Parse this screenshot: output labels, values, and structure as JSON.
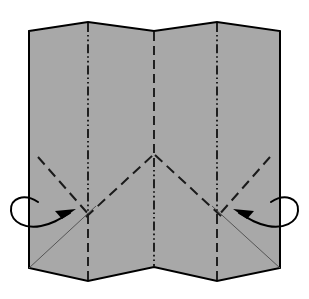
{
  "figure": {
    "type": "folding-instruction-diagram",
    "canvas": {
      "width": 309,
      "height": 299,
      "background": "#ffffff"
    },
    "colors": {
      "paper_fill": "#a8a8a8",
      "outline": "#000000",
      "crease_line": "#1a1a1a",
      "thin_fold_line": "#555555",
      "arrow": "#000000"
    },
    "paper": {
      "name": "pleated-sheet",
      "description": "Accordion-pleated square sheet seen face on, with zigzag top and bottom edges",
      "left_edge_x": 29,
      "right_edge_x": 280,
      "outline_points": "29,31 88,22 154,31 217,22 280,31 280,268 217,281 154,267 88,281 29,268",
      "outline_width": 2
    },
    "vertical_creases": [
      {
        "name": "left-mountain-crease",
        "x": 88,
        "upper": {
          "y1": 22,
          "y2": 215,
          "style": "dash-dot-dot"
        },
        "lower": {
          "y1": 215,
          "y2": 281,
          "style": "dashed"
        }
      },
      {
        "name": "center-valley-crease",
        "x": 154,
        "upper": {
          "y1": 31,
          "y2": 156,
          "style": "dashed"
        },
        "lower": {
          "y1": 156,
          "y2": 267,
          "style": "dash-dot-dot"
        }
      },
      {
        "name": "right-mountain-crease",
        "x": 217,
        "upper": {
          "y1": 22,
          "y2": 215,
          "style": "dash-dot-dot"
        },
        "lower": {
          "y1": 215,
          "y2": 281,
          "style": "dashed"
        }
      }
    ],
    "diagonal_creases": [
      {
        "name": "left-outer-diagonal-crease",
        "style": "dashed",
        "from": [
          38,
          157
        ],
        "to": [
          88,
          214
        ]
      },
      {
        "name": "left-inner-diagonal-crease",
        "style": "dashed",
        "from": [
          88,
          214
        ],
        "to": [
          154,
          156
        ]
      },
      {
        "name": "right-inner-diagonal-crease",
        "style": "dashed",
        "from": [
          154,
          156
        ],
        "to": [
          217,
          214
        ]
      },
      {
        "name": "right-outer-diagonal-crease",
        "style": "dashed",
        "from": [
          217,
          214
        ],
        "to": [
          270,
          157
        ]
      }
    ],
    "thin_fold_lines": [
      {
        "name": "left-lower-thin-fold-line",
        "from": [
          29,
          268
        ],
        "to": [
          96,
          206
        ],
        "width": 1
      },
      {
        "name": "right-lower-thin-fold-line",
        "from": [
          280,
          268
        ],
        "to": [
          212,
          206
        ],
        "width": 1
      }
    ],
    "arrows": [
      {
        "name": "left-wrap-around-arrow",
        "description": "Curved wrap-around arrow looping behind the left edge and pointing inward up-right",
        "tip": [
          73,
          211
        ],
        "direction": "inward-up-right"
      },
      {
        "name": "right-wrap-around-arrow",
        "description": "Curved wrap-around arrow looping behind the right edge and pointing inward up-left",
        "tip": [
          236,
          211
        ],
        "direction": "inward-up-left"
      }
    ],
    "legend": {
      "dashed": "valley fold",
      "dash-dot-dot": "mountain fold",
      "thin-solid": "hidden / existing fold edge",
      "curved-arrow": "wrap around to the back"
    }
  }
}
